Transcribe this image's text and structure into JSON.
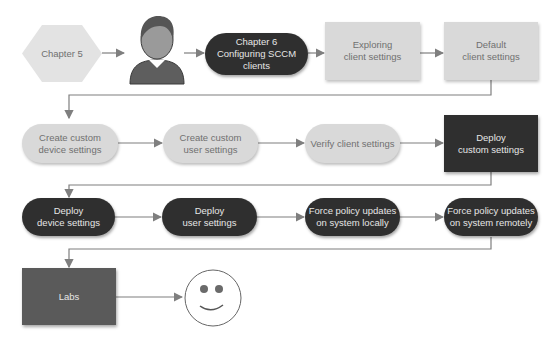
{
  "diagram": {
    "row1": {
      "chapter5": "Chapter 5",
      "chapter6": "Chapter 6\nConfiguring SCCM\nclients",
      "exploring": "Exploring\nclient settings",
      "default": "Default\nclient settings"
    },
    "row2": {
      "create_device": "Create custom\ndevice settings",
      "create_user": "Create custom\nuser settings",
      "verify": "Verify client settings",
      "deploy_custom": "Deploy\ncustom settings"
    },
    "row3": {
      "deploy_device": "Deploy\ndevice settings",
      "deploy_user": "Deploy\nuser settings",
      "force_local": "Force policy updates\non system locally",
      "force_remote": "Force policy updates\non system remotely"
    },
    "row4": {
      "labs": "Labs"
    },
    "icons": {
      "reader": "person-icon",
      "done": "smiley-icon"
    },
    "colors": {
      "light_fill": "#d9d9d9",
      "dark_fill": "#2f2f2f",
      "labs_fill": "#5a5a5a",
      "connector": "#7f7f7f"
    }
  }
}
